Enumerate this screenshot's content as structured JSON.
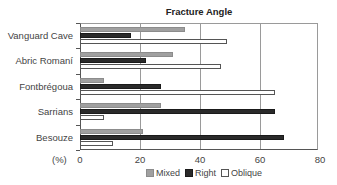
{
  "chart_data": {
    "type": "bar",
    "orientation": "horizontal",
    "title": "Fracture Angle",
    "xlabel": "(%)",
    "ylabel": "",
    "xlim": [
      0,
      80
    ],
    "xticks": [
      "0",
      "20",
      "40",
      "60",
      "80"
    ],
    "grid": "vertical",
    "legend_position": "bottom",
    "categories": [
      "Vanguard Cave",
      "Abric Romaní",
      "Fontbrégoua",
      "Sarrians",
      "Besouze"
    ],
    "series": [
      {
        "name": "Mixed",
        "color": "#a0a0a0",
        "values": [
          35,
          31,
          8,
          27,
          21
        ]
      },
      {
        "name": "Right",
        "color": "#2a2a2a",
        "values": [
          17,
          22,
          27,
          65,
          68
        ]
      },
      {
        "name": "Oblique",
        "color": "#ffffff",
        "values": [
          49,
          47,
          65,
          8,
          11
        ]
      }
    ]
  }
}
